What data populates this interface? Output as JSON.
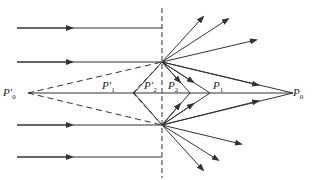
{
  "diagram": {
    "type": "optics-ray-diagram",
    "labels": {
      "P0": {
        "main": "P",
        "sub": "0"
      },
      "P1": {
        "main": "P",
        "sub": "1"
      },
      "P2": {
        "main": "P",
        "sub": "2"
      },
      "P0prime": {
        "main": "P′",
        "sub": "0"
      },
      "P1prime": {
        "main": "P′",
        "sub": "1"
      },
      "P2prime": {
        "main": "P′",
        "sub": "2"
      }
    },
    "colors": {
      "line": "#333333",
      "background": "#ffffff"
    }
  }
}
